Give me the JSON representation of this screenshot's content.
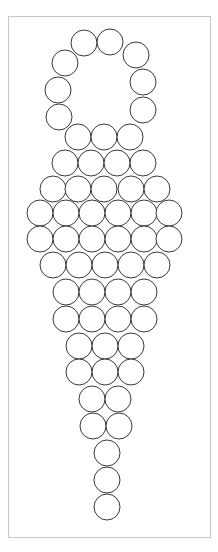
{
  "diagram": {
    "type": "bead-pattern",
    "frame": {
      "x": 8,
      "y": 16,
      "width": 202,
      "height": 521,
      "stroke": "#c8c8c8"
    },
    "bead_style": {
      "radius": 13,
      "stroke": "#3a3a3a",
      "fill": "#ffffff"
    },
    "groups": [
      {
        "name": "ring",
        "beads": [
          [
            84,
            43
          ],
          [
            110,
            42
          ],
          [
            136,
            55
          ],
          [
            143,
            82
          ],
          [
            143,
            110
          ],
          [
            65,
            63
          ],
          [
            58,
            90
          ],
          [
            59,
            117
          ]
        ]
      },
      {
        "name": "row-1",
        "beads": [
          [
            78,
            137
          ],
          [
            104,
            137
          ],
          [
            130,
            137
          ]
        ]
      },
      {
        "name": "row-2",
        "beads": [
          [
            65,
            163
          ],
          [
            91,
            163
          ],
          [
            117,
            163
          ],
          [
            143,
            163
          ]
        ]
      },
      {
        "name": "row-3",
        "beads": [
          [
            53,
            189
          ],
          [
            78,
            189
          ],
          [
            104,
            189
          ],
          [
            131,
            189
          ],
          [
            157,
            189
          ]
        ]
      },
      {
        "name": "row-4",
        "beads": [
          [
            40,
            213
          ],
          [
            66,
            213
          ],
          [
            92,
            213
          ],
          [
            118,
            213
          ],
          [
            144,
            213
          ],
          [
            169,
            213
          ]
        ]
      },
      {
        "name": "row-5",
        "beads": [
          [
            40,
            239
          ],
          [
            66,
            239
          ],
          [
            92,
            239
          ],
          [
            118,
            239
          ],
          [
            144,
            239
          ],
          [
            169,
            239
          ]
        ]
      },
      {
        "name": "row-6",
        "beads": [
          [
            53,
            265
          ],
          [
            79,
            265
          ],
          [
            105,
            265
          ],
          [
            131,
            265
          ],
          [
            157,
            265
          ]
        ]
      },
      {
        "name": "row-7",
        "beads": [
          [
            66,
            292
          ],
          [
            92,
            292
          ],
          [
            118,
            292
          ],
          [
            144,
            292
          ]
        ]
      },
      {
        "name": "row-8",
        "beads": [
          [
            66,
            319
          ],
          [
            92,
            319
          ],
          [
            118,
            319
          ],
          [
            144,
            319
          ]
        ]
      },
      {
        "name": "row-9",
        "beads": [
          [
            79,
            346
          ],
          [
            105,
            346
          ],
          [
            131,
            346
          ]
        ]
      },
      {
        "name": "row-10",
        "beads": [
          [
            79,
            372
          ],
          [
            105,
            372
          ],
          [
            131,
            372
          ]
        ]
      },
      {
        "name": "row-11",
        "beads": [
          [
            92,
            399
          ],
          [
            118,
            399
          ]
        ]
      },
      {
        "name": "row-12",
        "beads": [
          [
            93,
            426
          ],
          [
            119,
            426
          ]
        ]
      },
      {
        "name": "row-13",
        "beads": [
          [
            107,
            453
          ]
        ]
      },
      {
        "name": "row-14",
        "beads": [
          [
            107,
            480
          ]
        ]
      },
      {
        "name": "row-15",
        "beads": [
          [
            107,
            507
          ]
        ]
      }
    ],
    "total_beads": 58
  }
}
